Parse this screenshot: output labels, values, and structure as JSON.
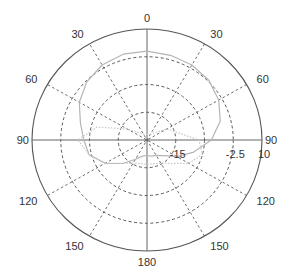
{
  "chart_data": {
    "type": "polar",
    "title": "",
    "angle_ticks": [
      {
        "label": "0",
        "deg": 0
      },
      {
        "label": "30",
        "deg": 30
      },
      {
        "label": "60",
        "deg": 60
      },
      {
        "label": "90",
        "deg": 90
      },
      {
        "label": "120",
        "deg": 120
      },
      {
        "label": "150",
        "deg": 150
      },
      {
        "label": "180",
        "deg": 180
      },
      {
        "label": "150",
        "deg": 210
      },
      {
        "label": "120",
        "deg": 240
      },
      {
        "label": "90",
        "deg": 270
      },
      {
        "label": "60",
        "deg": 300
      },
      {
        "label": "30",
        "deg": 330
      }
    ],
    "radial_ticks": [
      {
        "label": "-15",
        "frac": 0.25
      },
      {
        "label": "-2.5",
        "frac": 0.75
      },
      {
        "label": "10",
        "frac": 1.0
      }
    ],
    "radial_range": [
      -20,
      10
    ],
    "rings_frac": [
      0.25,
      0.5,
      0.75,
      1.0
    ],
    "grid": true,
    "series": [
      {
        "name": "pattern-a",
        "style": "solid",
        "color": "#b5b5b5",
        "deg": [
          0,
          15,
          30,
          45,
          60,
          75,
          90,
          105,
          120,
          135,
          150,
          165,
          180,
          195,
          210,
          225,
          240,
          255,
          270,
          285,
          300,
          315,
          330,
          345,
          360
        ],
        "frac": [
          0.8,
          0.79,
          0.78,
          0.76,
          0.72,
          0.66,
          0.56,
          0.42,
          0.3,
          0.2,
          0.16,
          0.15,
          0.14,
          0.15,
          0.2,
          0.3,
          0.42,
          0.52,
          0.55,
          0.6,
          0.68,
          0.74,
          0.78,
          0.8,
          0.8
        ]
      },
      {
        "name": "pattern-b",
        "style": "dotted",
        "color": "#c8c8c8",
        "deg": [
          0,
          30,
          60,
          90,
          105,
          120,
          135,
          150,
          165,
          180,
          195,
          210,
          225,
          240,
          255,
          270,
          285,
          300,
          330,
          360
        ],
        "frac": [
          0.05,
          0.06,
          0.2,
          0.45,
          0.5,
          0.42,
          0.3,
          0.24,
          0.22,
          0.22,
          0.22,
          0.24,
          0.3,
          0.42,
          0.52,
          0.6,
          0.45,
          0.2,
          0.06,
          0.05
        ]
      }
    ]
  }
}
